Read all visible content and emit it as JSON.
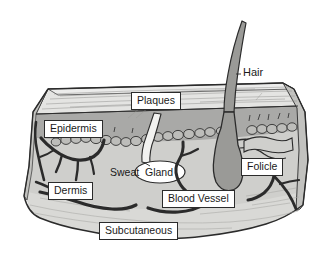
{
  "figure": {
    "background_color": "#ffffff",
    "width": 325,
    "height": 256
  },
  "labels": {
    "plaques": "Plaques",
    "epidermis": "Epidermis",
    "dermis": "Dermis",
    "subcutaneous": "Subcutaneous",
    "blood_vessel": "Blood Vessel",
    "sweat": "Sweat",
    "gland": "Gland",
    "folicle": "Folicle",
    "hair": "Hair"
  },
  "colors": {
    "outline": "#2b2b2b",
    "stratum_corneum": "#e4e4e2",
    "epidermis_band": "#a9a9a7",
    "dermis": "#cfcfcc",
    "subcutaneous": "#d9d9d6",
    "side_face": "#c2c2bf",
    "hair_fill": "#9a9a97",
    "follicle_fill": "#9a9a97",
    "vessel": "#2b2b2b",
    "duct_fill": "#f2f2f0",
    "papilla_fill": "#bdbdba",
    "label_text": "#1a1a1a",
    "label_box": "#ffffff"
  },
  "structures": [
    {
      "name": "plaques",
      "label": "Plaques",
      "layer_order": 1,
      "description": "thin striated surface layer at top of skin block"
    },
    {
      "name": "epidermis",
      "label": "Epidermis",
      "layer_order": 2,
      "description": "darker gray band beneath the surface layer"
    },
    {
      "name": "dermis",
      "label": "Dermis",
      "layer_order": 3,
      "description": "large light-gray middle layer containing vessels and glands"
    },
    {
      "name": "subcutaneous",
      "label": "Subcutaneous",
      "layer_order": 4,
      "description": "lowest layer with wavy bottom edge"
    },
    {
      "name": "hair",
      "label": "Hair",
      "description": "curved tapering shaft rising above skin surface"
    },
    {
      "name": "folicle",
      "label": "Folicle",
      "description": "elongated bulb anchoring the hair in the dermis"
    },
    {
      "name": "sweat-gland",
      "label": "Sweat Gland",
      "description": "duct from surface leading to oval gland sac"
    },
    {
      "name": "blood-vessel",
      "label": "Blood Vessel",
      "description": "dark branching vessel trees through dermis"
    }
  ]
}
